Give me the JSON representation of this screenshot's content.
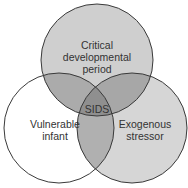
{
  "diagram": {
    "type": "venn",
    "sets": [
      {
        "id": "top",
        "label_lines": [
          "Critical",
          "developmental",
          "period"
        ],
        "fill": "#cfcfcf"
      },
      {
        "id": "left",
        "label_lines": [
          "Vulnerable",
          "infant"
        ],
        "fill": "#ffffff"
      },
      {
        "id": "right",
        "label_lines": [
          "Exogenous",
          "stressor"
        ],
        "fill": "#d6d6d6"
      }
    ],
    "center_label": "SIDS",
    "colors": {
      "pair_overlap": "#a9a9a9",
      "center_overlap": "#8f8f8f",
      "stroke": "#3a3a3a"
    }
  }
}
